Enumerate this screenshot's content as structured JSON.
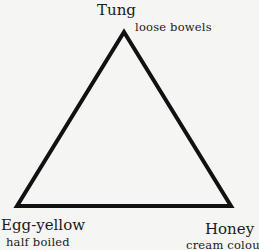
{
  "diagram": {
    "type": "triangle",
    "stroke_color": "#111111",
    "background": "#f5f5f4",
    "vertices": {
      "top": {
        "name": "Tung",
        "description": "loose bowels"
      },
      "bottom_left": {
        "name": "Egg-yellow",
        "description": "half boiled"
      },
      "bottom_right": {
        "name": "Honey",
        "description": "cream colour"
      }
    }
  }
}
